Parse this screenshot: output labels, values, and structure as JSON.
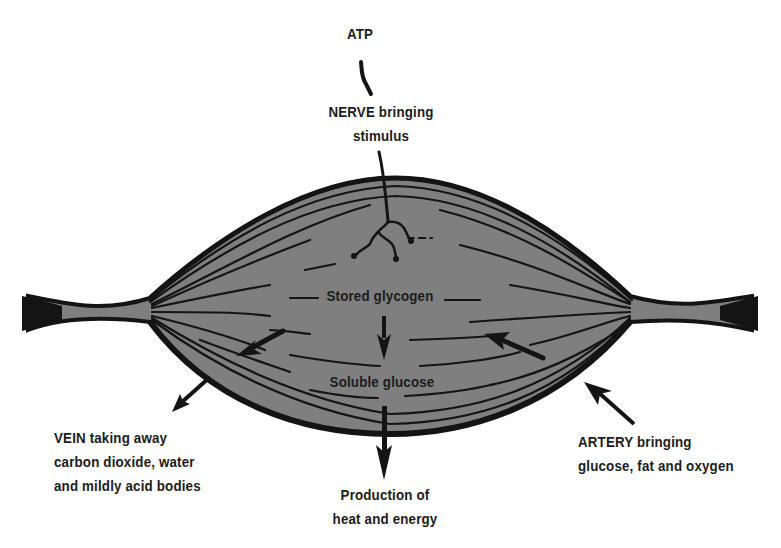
{
  "diagram": {
    "colors": {
      "background": "#ffffff",
      "muscle_fill": "#7f7f7f",
      "ink": "#141414",
      "text": "#1c1c1c"
    },
    "labels": {
      "atp": "ATP",
      "nerve": {
        "line1": "NERVE bringing",
        "line2": "stimulus"
      },
      "stored": "Stored glycogen",
      "soluble": "Soluble glucose",
      "production": {
        "line1": "Production of",
        "line2": "heat and energy"
      },
      "vein": {
        "line1": "VEIN taking away",
        "line2": "carbon dioxide, water",
        "line3": "and mildly acid bodies"
      },
      "artery": {
        "line1": "ARTERY bringing",
        "line2": "glucose, fat and oxygen"
      }
    },
    "arrows": [
      {
        "name": "glycogen-to-glucose",
        "direction": "down"
      },
      {
        "name": "glucose-to-energy",
        "direction": "down"
      },
      {
        "name": "vein-outflow",
        "direction": "down-left"
      },
      {
        "name": "artery-inflow",
        "direction": "up-left"
      }
    ]
  }
}
